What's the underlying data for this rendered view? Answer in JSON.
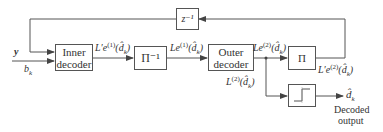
{
  "diagram": {
    "type": "block-diagram",
    "blocks": [
      {
        "id": "delay",
        "label": "z⁻¹"
      },
      {
        "id": "inner_decoder",
        "label_line1": "Inner",
        "label_line2": "decoder"
      },
      {
        "id": "deinterleaver",
        "label": "Π⁻¹"
      },
      {
        "id": "outer_decoder",
        "label_line1": "Outer",
        "label_line2": "decoder"
      },
      {
        "id": "interleaver",
        "label": "Π"
      },
      {
        "id": "hard_decision",
        "label": "threshold"
      }
    ],
    "signals": {
      "input_y": "y",
      "input_b": "b",
      "input_b_sub": "k",
      "inner_out": {
        "main": "L′e",
        "sup": "(1)",
        "arg": "(d̂",
        "arg_sub": "k",
        "close": ")"
      },
      "deint_out": {
        "main": "Le",
        "sup": "(1)",
        "arg": "(d̂",
        "arg_sub": "k",
        "close": ")"
      },
      "outer_out": {
        "main": "Le",
        "sup": "(2)",
        "arg": "(d̂",
        "arg_sub": "k",
        "close": ")"
      },
      "int_out": {
        "main": "L′e",
        "sup": "(2)",
        "arg": "(d̂",
        "arg_sub": "k",
        "close": ")"
      },
      "llr": {
        "main": "L",
        "sup": "(2)",
        "arg": "(d̂",
        "arg_sub": "k",
        "close": ")"
      },
      "output": {
        "main": "d̂",
        "sub": "k"
      },
      "output_caption_line1": "Decoded",
      "output_caption_line2": "output"
    },
    "colors": {
      "line": "#555555",
      "text": "#333333",
      "background": "#ffffff"
    }
  }
}
